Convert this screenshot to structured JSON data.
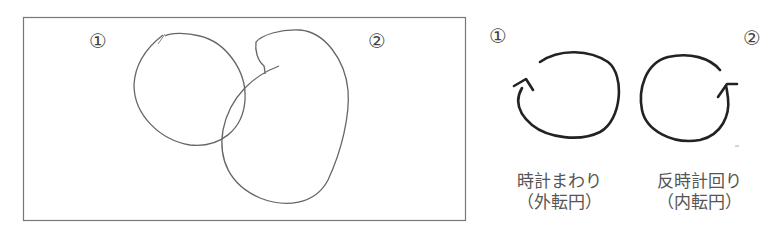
{
  "left_panel": {
    "marker_1": "①",
    "marker_2": "②"
  },
  "right_panel": {
    "marker_1": "①",
    "marker_2": "②",
    "items": [
      {
        "line1": "時計まわり",
        "line2": "（外転円）",
        "direction": "clockwise"
      },
      {
        "line1": "反時計回り",
        "line2": "（内転円）",
        "direction": "counterclockwise"
      }
    ]
  },
  "colors": {
    "stroke": "#555555",
    "arrow_stroke": "#222222",
    "frame": "#777777"
  }
}
